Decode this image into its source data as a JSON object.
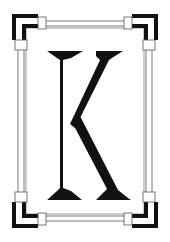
{
  "image": {
    "subject": "decorative-initial-letter",
    "letter": "K",
    "frame_style": "art-deco-corner-brackets"
  },
  "colors": {
    "background": "#ffffff",
    "ink": "#111111",
    "line": "#555555"
  }
}
